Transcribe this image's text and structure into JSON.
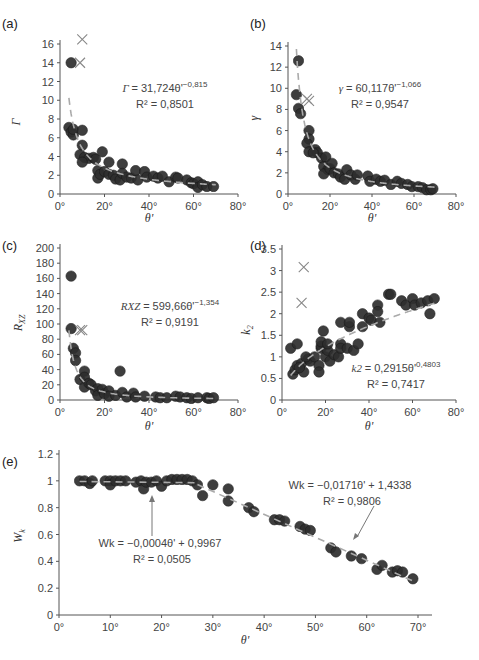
{
  "chart_data": [
    {
      "panel": "(a)",
      "type": "scatter",
      "xlabel": "θ'",
      "ylabel": "Γ",
      "xlim": [
        0,
        80
      ],
      "ylim": [
        0,
        16
      ],
      "xticks": [
        "0°",
        "20°",
        "40°",
        "60°",
        "80°"
      ],
      "yticks": [
        "0",
        "2",
        "4",
        "6",
        "8",
        "10",
        "12",
        "14",
        "16"
      ],
      "equation": "Γ = 31,724θ'^−0,815",
      "r2": "R² = 0,8501",
      "fit": {
        "type": "power",
        "a": 31.724,
        "b": -0.815
      },
      "outliers_x": [
        [
          10,
          16.5
        ],
        [
          9,
          14
        ]
      ],
      "points": [
        [
          5,
          14
        ],
        [
          4,
          7.1
        ],
        [
          5,
          6.6
        ],
        [
          6,
          6.3
        ],
        [
          6,
          6.9
        ],
        [
          10,
          6.8
        ],
        [
          10,
          5.2
        ],
        [
          9,
          4.2
        ],
        [
          11,
          3.9
        ],
        [
          13,
          3.8
        ],
        [
          15,
          3.9
        ],
        [
          16,
          3.7
        ],
        [
          19,
          4.5
        ],
        [
          10,
          3.4
        ],
        [
          17,
          2.5
        ],
        [
          17,
          1.7
        ],
        [
          18,
          2.1
        ],
        [
          20,
          2.4
        ],
        [
          22,
          2.1
        ],
        [
          24,
          2.0
        ],
        [
          22,
          3.4
        ],
        [
          25,
          1.6
        ],
        [
          27,
          1.5
        ],
        [
          28,
          3.2
        ],
        [
          28,
          2.2
        ],
        [
          30,
          1.8
        ],
        [
          32,
          1.7
        ],
        [
          34,
          2.5
        ],
        [
          35,
          1.5
        ],
        [
          38,
          2.4
        ],
        [
          39,
          1.8
        ],
        [
          42,
          1.9
        ],
        [
          44,
          1.7
        ],
        [
          46,
          1.9
        ],
        [
          49,
          1.3
        ],
        [
          52,
          1.8
        ],
        [
          53,
          1.7
        ],
        [
          57,
          1.5
        ],
        [
          59,
          1.2
        ],
        [
          60,
          1.1
        ],
        [
          62,
          1.3
        ],
        [
          62,
          0.7
        ],
        [
          64,
          1.0
        ],
        [
          66,
          0.8
        ],
        [
          69,
          0.8
        ]
      ]
    },
    {
      "panel": "(b)",
      "type": "scatter",
      "xlabel": "θ'",
      "ylabel": "γ",
      "xlim": [
        0,
        80
      ],
      "ylim": [
        0,
        14
      ],
      "xticks": [
        "0°",
        "20°",
        "40°",
        "60°",
        "80°"
      ],
      "yticks": [
        "0",
        "2",
        "4",
        "6",
        "8",
        "10",
        "12",
        "14"
      ],
      "equation": "γ = 60,117θ'^−1,066",
      "r2": "R² = 0,9547",
      "fit": {
        "type": "power",
        "a": 60.117,
        "b": -1.066
      },
      "outliers_x": [
        [
          9,
          9
        ],
        [
          10,
          8.8
        ]
      ],
      "points": [
        [
          5,
          12.6
        ],
        [
          4,
          9.4
        ],
        [
          5,
          8.1
        ],
        [
          6,
          7.6
        ],
        [
          10,
          6.0
        ],
        [
          10,
          5.2
        ],
        [
          9,
          4.8
        ],
        [
          10,
          4.0
        ],
        [
          13,
          4.2
        ],
        [
          14,
          3.9
        ],
        [
          16,
          3.4
        ],
        [
          18,
          3.5
        ],
        [
          12,
          3.9
        ],
        [
          17,
          2.6
        ],
        [
          19,
          2.3
        ],
        [
          17,
          1.9
        ],
        [
          20,
          2.4
        ],
        [
          21,
          2.9
        ],
        [
          22,
          2.0
        ],
        [
          24,
          1.9
        ],
        [
          25,
          1.6
        ],
        [
          27,
          1.4
        ],
        [
          28,
          2.3
        ],
        [
          30,
          1.8
        ],
        [
          32,
          1.4
        ],
        [
          33,
          1.8
        ],
        [
          38,
          1.7
        ],
        [
          39,
          1.2
        ],
        [
          42,
          1.4
        ],
        [
          44,
          1.2
        ],
        [
          46,
          1.3
        ],
        [
          49,
          0.9
        ],
        [
          52,
          1.2
        ],
        [
          54,
          1.0
        ],
        [
          57,
          0.9
        ],
        [
          59,
          0.7
        ],
        [
          62,
          0.7
        ],
        [
          64,
          0.6
        ],
        [
          66,
          0.4
        ],
        [
          68,
          0.4
        ],
        [
          69,
          0.5
        ]
      ]
    },
    {
      "panel": "(c)",
      "type": "scatter",
      "xlabel": "θ'",
      "ylabel": "R_XZ",
      "xlim": [
        0,
        80
      ],
      "ylim": [
        0,
        200
      ],
      "xticks": [
        "0°",
        "20°",
        "40°",
        "60°",
        "80°"
      ],
      "yticks": [
        "0",
        "20",
        "40",
        "60",
        "80",
        "100",
        "120",
        "140",
        "160",
        "180",
        "200"
      ],
      "equation": "R_XZ = 599,66θ'^−1,354",
      "r2": "R² = 0,9191",
      "fit": {
        "type": "power",
        "a": 599.66,
        "b": -1.354
      },
      "outliers_x": [
        [
          9,
          92
        ],
        [
          10,
          92
        ]
      ],
      "points": [
        [
          5,
          163
        ],
        [
          5,
          94
        ],
        [
          6,
          68
        ],
        [
          7,
          62
        ],
        [
          7,
          52
        ],
        [
          9,
          27
        ],
        [
          11,
          38
        ],
        [
          11,
          30
        ],
        [
          11,
          17
        ],
        [
          13,
          22
        ],
        [
          14,
          20
        ],
        [
          16,
          12
        ],
        [
          17,
          15
        ],
        [
          17,
          6
        ],
        [
          19,
          14
        ],
        [
          20,
          8
        ],
        [
          22,
          12
        ],
        [
          22,
          5
        ],
        [
          25,
          6
        ],
        [
          27,
          38
        ],
        [
          28,
          10
        ],
        [
          30,
          4
        ],
        [
          33,
          9
        ],
        [
          34,
          4
        ],
        [
          38,
          5
        ],
        [
          43,
          4
        ],
        [
          45,
          3
        ],
        [
          48,
          3
        ],
        [
          52,
          5
        ],
        [
          54,
          4
        ],
        [
          57,
          3
        ],
        [
          59,
          2
        ],
        [
          62,
          3
        ],
        [
          66,
          3
        ],
        [
          67,
          2
        ],
        [
          69,
          3
        ]
      ]
    },
    {
      "panel": "(d)",
      "type": "scatter",
      "xlabel": "θ'",
      "ylabel": "k₂",
      "xlim": [
        0,
        80
      ],
      "ylim": [
        0,
        3.5
      ],
      "xticks": [
        "0°",
        "20°",
        "40°",
        "60°",
        "80°"
      ],
      "yticks": [
        "0",
        "0.5",
        "1",
        "1.5",
        "2",
        "2.5",
        "3",
        "3.5"
      ],
      "equation": "k₂ = 0,2915θ'^0,4803",
      "r2": "R² = 0,7417",
      "fit": {
        "type": "power",
        "a": 0.2915,
        "b": 0.4803
      },
      "outliers_x": [
        [
          10,
          3.08
        ],
        [
          9,
          2.25
        ]
      ],
      "points": [
        [
          5,
          0.6
        ],
        [
          6,
          0.7
        ],
        [
          7,
          0.8
        ],
        [
          9,
          0.85
        ],
        [
          10,
          0.65
        ],
        [
          12,
          0.95
        ],
        [
          13,
          0.9
        ],
        [
          11,
          1.0
        ],
        [
          15,
          1.0
        ],
        [
          17,
          0.8
        ],
        [
          17,
          0.65
        ],
        [
          18,
          1.2
        ],
        [
          18,
          1.25
        ],
        [
          18,
          1.35
        ],
        [
          19,
          1.6
        ],
        [
          20,
          1.0
        ],
        [
          21,
          1.15
        ],
        [
          21,
          1.3
        ],
        [
          22,
          0.9
        ],
        [
          24,
          1.05
        ],
        [
          26,
          1.0
        ],
        [
          27,
          1.3
        ],
        [
          27,
          1.2
        ],
        [
          27,
          1.8
        ],
        [
          30,
          1.2
        ],
        [
          31,
          1.7
        ],
        [
          31,
          1.8
        ],
        [
          33,
          1.15
        ],
        [
          35,
          1.3
        ],
        [
          37,
          2.0
        ],
        [
          37,
          1.7
        ],
        [
          40,
          1.9
        ],
        [
          41,
          1.85
        ],
        [
          44,
          2.2
        ],
        [
          44,
          2.05
        ],
        [
          45,
          1.8
        ],
        [
          49,
          2.45
        ],
        [
          50,
          2.45
        ],
        [
          55,
          2.3
        ],
        [
          57,
          2.2
        ],
        [
          60,
          2.35
        ],
        [
          61,
          2.2
        ],
        [
          64,
          2.25
        ],
        [
          67,
          2.3
        ],
        [
          68,
          2.0
        ],
        [
          70,
          2.35
        ],
        [
          8,
          0.75
        ],
        [
          4,
          1.2
        ],
        [
          7,
          1.3
        ]
      ]
    },
    {
      "panel": "(e)",
      "type": "scatter",
      "xlabel": "θ'",
      "ylabel": "W_k",
      "xlim": [
        0,
        70
      ],
      "ylim": [
        0,
        1.2
      ],
      "xticks": [
        "0°",
        "10°",
        "20°",
        "30°",
        "40°",
        "50°",
        "60°",
        "70°"
      ],
      "yticks": [
        "0",
        "0.2",
        "0.4",
        "0.6",
        "0.8",
        "1",
        "1.2"
      ],
      "fits": [
        {
          "equation": "W_k = −0,0004θ' + 0,9967",
          "r2": "R² = 0,0505",
          "type": "linear",
          "slope": -0.0004,
          "intercept": 0.9967,
          "range": [
            4,
            27
          ]
        },
        {
          "equation": "W_k = −0,0171θ' + 1,4338",
          "r2": "R² = 0,9806",
          "type": "linear",
          "slope": -0.0171,
          "intercept": 1.4338,
          "range": [
            27,
            69
          ]
        }
      ],
      "points": [
        [
          4,
          1.0
        ],
        [
          5,
          1.0
        ],
        [
          6,
          0.98
        ],
        [
          6.5,
          1.0
        ],
        [
          9,
          1.0
        ],
        [
          10,
          1.0
        ],
        [
          10,
          0.97
        ],
        [
          11,
          1.0
        ],
        [
          12,
          1.0
        ],
        [
          13,
          1.0
        ],
        [
          15,
          0.99
        ],
        [
          16,
          1.0
        ],
        [
          16.5,
          0.94
        ],
        [
          17,
          0.99
        ],
        [
          18,
          0.99
        ],
        [
          19,
          1.0
        ],
        [
          20,
          0.96
        ],
        [
          21,
          1.0
        ],
        [
          22,
          1.01
        ],
        [
          23,
          1.01
        ],
        [
          24,
          1.01
        ],
        [
          25,
          1.01
        ],
        [
          26,
          1.0
        ],
        [
          27,
          0.97
        ],
        [
          28,
          0.89
        ],
        [
          30,
          0.97
        ],
        [
          33,
          0.94
        ],
        [
          33,
          0.85
        ],
        [
          37,
          0.8
        ],
        [
          38,
          0.77
        ],
        [
          42,
          0.71
        ],
        [
          43,
          0.71
        ],
        [
          44,
          0.7
        ],
        [
          47,
          0.66
        ],
        [
          48,
          0.64
        ],
        [
          49,
          0.63
        ],
        [
          53,
          0.5
        ],
        [
          54,
          0.47
        ],
        [
          57,
          0.44
        ],
        [
          59,
          0.42
        ],
        [
          62,
          0.34
        ],
        [
          63,
          0.37
        ],
        [
          65,
          0.32
        ],
        [
          66,
          0.33
        ],
        [
          67,
          0.32
        ],
        [
          69,
          0.27
        ]
      ]
    }
  ],
  "panels": {
    "a": {
      "label": "(a)",
      "ylabel": "Γ",
      "xlabel": "θ'",
      "eq_main": "Γ = 31,724θ'",
      "eq_exp": "−0,815",
      "r2": "R² = 0,8501"
    },
    "b": {
      "label": "(b)",
      "ylabel": "γ",
      "xlabel": "θ'",
      "eq_main": "γ = 60,117θ'",
      "eq_exp": "−1,066",
      "r2": "R² = 0,9547"
    },
    "c": {
      "label": "(c)",
      "ylabel": "RXZ",
      "xlabel": "θ'",
      "eq_main": "RXZ = 599,66θ'",
      "eq_exp": "−1,354",
      "r2": "R² = 0,9191"
    },
    "d": {
      "label": "(d)",
      "ylabel": "k2",
      "xlabel": "θ'",
      "eq_main": "k2 = 0,2915θ'",
      "eq_exp": "0,4803",
      "r2": "R² = 0,7417"
    },
    "e": {
      "label": "(e)",
      "ylabel": "Wk",
      "xlabel": "θ'",
      "eq1": "Wk = −0,0004θ' + 0,9967",
      "r2_1": "R² = 0,0505",
      "eq2": "Wk = −0,0171θ' + 1,4338",
      "r2_2": "R² = 0,9806"
    }
  },
  "colors": {
    "marker": "#2e2e2e",
    "fit_line": "#aaaaaa",
    "axis": "#555555",
    "outlier": "#888888",
    "arrow": "#777777"
  }
}
